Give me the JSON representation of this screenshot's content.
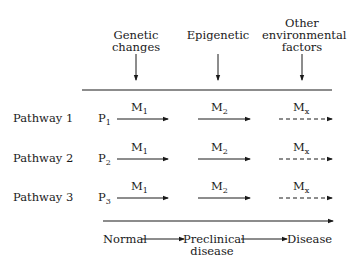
{
  "factors": [
    {
      "label_line1": "Genetic",
      "label_line2": "changes"
    },
    {
      "label_line1": "Epigenetic",
      "label_line2": ""
    },
    {
      "label_line1": "Other",
      "label_line2": "environmental",
      "label_line3": "factors"
    }
  ],
  "pathways": [
    {
      "label": "Pathway 1",
      "start": "P",
      "start_sub": "1",
      "steps": [
        {
          "m": "M",
          "sub": "1"
        },
        {
          "m": "M",
          "sub": "2"
        },
        {
          "m": "M",
          "sub": "x"
        }
      ]
    },
    {
      "label": "Pathway 2",
      "start": "P",
      "start_sub": "2",
      "steps": [
        {
          "m": "M",
          "sub": "1"
        },
        {
          "m": "M",
          "sub": "2"
        },
        {
          "m": "M",
          "sub": "x"
        }
      ]
    },
    {
      "label": "Pathway 3",
      "start": "P",
      "start_sub": "3",
      "steps": [
        {
          "m": "M",
          "sub": "1"
        },
        {
          "m": "M",
          "sub": "2"
        },
        {
          "m": "M",
          "sub": "x"
        }
      ]
    }
  ],
  "stages": {
    "normal": "Normal",
    "preclinical_line1": "Preclinical",
    "preclinical_line2": "disease",
    "disease": "Disease"
  }
}
